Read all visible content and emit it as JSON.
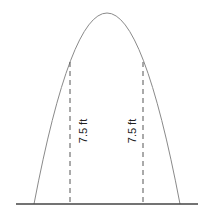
{
  "diagram": {
    "type": "parabolic-arch",
    "labels": [
      {
        "text": "7.5 ft",
        "position": "left"
      },
      {
        "text": "7.5 ft",
        "position": "right"
      }
    ],
    "colors": {
      "arch": "#8a8a8a",
      "ground": "#444444",
      "dashed": "#555555",
      "text": "#222222"
    }
  }
}
